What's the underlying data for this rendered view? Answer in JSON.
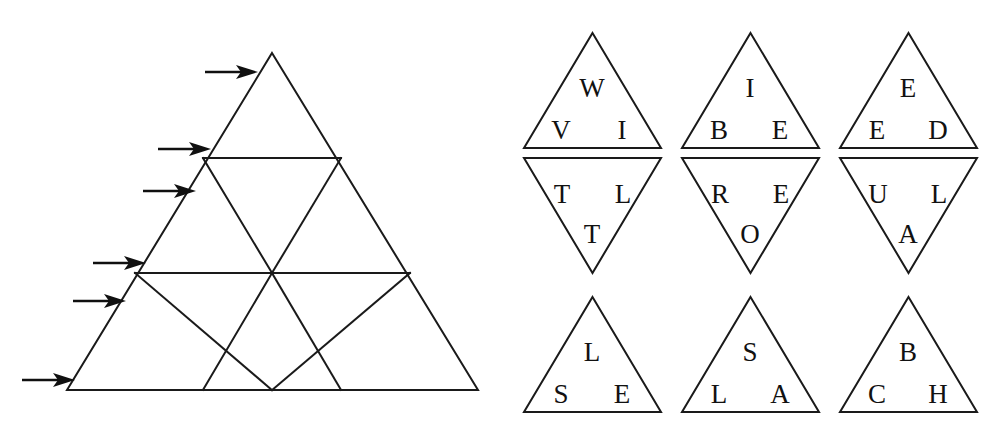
{
  "figure": {
    "left_panel": {
      "name": "subdivided-triangle-diagram",
      "description": "Large equilateral triangle subdivided into nine small triangles across three rows, with six arrows pointing at its left side",
      "rows": 3,
      "small_triangle_count": 9,
      "outline": {
        "apex": [
          272,
          53
        ],
        "bottom_left": [
          67,
          390
        ],
        "bottom_right": [
          478,
          390
        ]
      },
      "horizontal_lines": [
        {
          "name": "row1-base",
          "y": 158,
          "x1": 203,
          "x2": 341
        },
        {
          "name": "row2-base",
          "y": 273,
          "x1": 135,
          "x2": 410
        }
      ],
      "internal_edges_visible": true,
      "arrows": [
        {
          "id": 1,
          "label": "arrow-row1",
          "tail_x": 205,
          "tip_x": 258,
          "y": 72
        },
        {
          "id": 2,
          "label": "arrow-row2-top",
          "tail_x": 158,
          "tip_x": 210,
          "y": 149
        },
        {
          "id": 3,
          "label": "arrow-row2-mid",
          "tail_x": 143,
          "tip_x": 196,
          "y": 191
        },
        {
          "id": 4,
          "label": "arrow-row3-top",
          "tail_x": 93,
          "tip_x": 146,
          "y": 263
        },
        {
          "id": 5,
          "label": "arrow-row3-mid",
          "tail_x": 73,
          "tip_x": 126,
          "y": 301
        },
        {
          "id": 6,
          "label": "arrow-row3-base",
          "tail_x": 22,
          "tip_x": 75,
          "y": 380
        }
      ]
    },
    "right_panel": {
      "name": "letter-triangle-tiles",
      "description": "Nine triangular tiles arranged in three columns; the top two rows form diamonds of an upward and a downward triangle, the bottom row has three upward triangles",
      "tiles": [
        {
          "id": "tile-1",
          "orientation": "up",
          "row": 1,
          "column": 1,
          "letters": {
            "top": "W",
            "bottom_left": "V",
            "bottom_right": "I"
          },
          "letters_flat": [
            "W",
            "V",
            "I"
          ],
          "geometry": {
            "left": 524,
            "right": 661,
            "apex_y": 33,
            "base_y": 148
          }
        },
        {
          "id": "tile-2",
          "orientation": "up",
          "row": 1,
          "column": 2,
          "letters": {
            "top": "I",
            "bottom_left": "B",
            "bottom_right": "E"
          },
          "letters_flat": [
            "I",
            "B",
            "E"
          ],
          "geometry": {
            "left": 682,
            "right": 819,
            "apex_y": 33,
            "base_y": 148
          }
        },
        {
          "id": "tile-3",
          "orientation": "up",
          "row": 1,
          "column": 3,
          "letters": {
            "top": "E",
            "bottom_left": "E",
            "bottom_right": "D"
          },
          "letters_flat": [
            "E",
            "E",
            "D"
          ],
          "geometry": {
            "left": 840,
            "right": 977,
            "apex_y": 33,
            "base_y": 148
          }
        },
        {
          "id": "tile-4",
          "orientation": "down",
          "row": 2,
          "column": 1,
          "letters": {
            "top_left": "T",
            "top_right": "L",
            "bottom": "T"
          },
          "letters_flat": [
            "T",
            "L",
            "T"
          ],
          "geometry": {
            "left": 524,
            "right": 661,
            "top_y": 158,
            "bottom_y": 273
          }
        },
        {
          "id": "tile-5",
          "orientation": "down",
          "row": 2,
          "column": 2,
          "letters": {
            "top_left": "R",
            "top_right": "E",
            "bottom": "O"
          },
          "letters_flat": [
            "R",
            "E",
            "O"
          ],
          "geometry": {
            "left": 682,
            "right": 819,
            "top_y": 158,
            "bottom_y": 273
          }
        },
        {
          "id": "tile-6",
          "orientation": "down",
          "row": 2,
          "column": 3,
          "letters": {
            "top_left": "U",
            "top_right": "L",
            "bottom": "A"
          },
          "letters_flat": [
            "U",
            "L",
            "A"
          ],
          "geometry": {
            "left": 840,
            "right": 977,
            "top_y": 158,
            "bottom_y": 273
          }
        },
        {
          "id": "tile-7",
          "orientation": "up",
          "row": 3,
          "column": 1,
          "letters": {
            "top": "L",
            "bottom_left": "S",
            "bottom_right": "E"
          },
          "letters_flat": [
            "L",
            "S",
            "E"
          ],
          "geometry": {
            "left": 524,
            "right": 661,
            "apex_y": 297,
            "base_y": 412
          }
        },
        {
          "id": "tile-8",
          "orientation": "up",
          "row": 3,
          "column": 2,
          "letters": {
            "top": "S",
            "bottom_left": "L",
            "bottom_right": "A"
          },
          "letters_flat": [
            "S",
            "L",
            "A"
          ],
          "geometry": {
            "left": 682,
            "right": 819,
            "apex_y": 297,
            "base_y": 412
          }
        },
        {
          "id": "tile-9",
          "orientation": "up",
          "row": 3,
          "column": 3,
          "letters": {
            "top": "B",
            "bottom_left": "C",
            "bottom_right": "H"
          },
          "letters_flat": [
            "B",
            "C",
            "H"
          ],
          "geometry": {
            "left": 840,
            "right": 977,
            "apex_y": 297,
            "base_y": 412
          }
        }
      ]
    },
    "colors": {
      "background": "#ffffff",
      "stroke": "#1a1a1a",
      "arrow": "#101010",
      "letter": "#111111"
    }
  }
}
